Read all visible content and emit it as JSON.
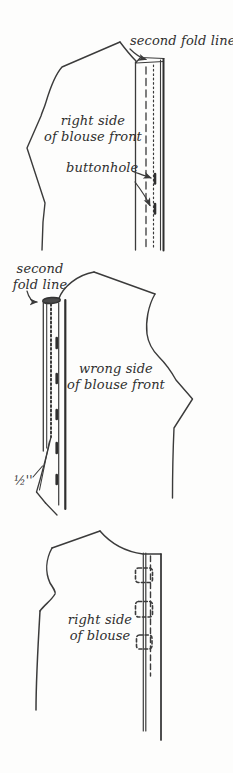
{
  "page": {
    "background": "#fdfdfc",
    "ink_color": "#3b3b3b",
    "text_color": "#2f2f2f"
  },
  "figures": [
    {
      "id": "top-diagram",
      "description": "blouse front right side with buttonhole band",
      "labels": {
        "fold_line": "second fold line",
        "side": "right side\nof blouse front",
        "buttonhole": "buttonhole"
      }
    },
    {
      "id": "middle-diagram",
      "description": "blouse front wrong side with folded band",
      "labels": {
        "fold_line": "second\nfold line",
        "side": "wrong side\nof blouse front",
        "measurement": "½''"
      }
    },
    {
      "id": "bottom-diagram",
      "description": "finished blouse right side with buttonholes",
      "labels": {
        "side": "right side\nof blouse"
      }
    }
  ]
}
